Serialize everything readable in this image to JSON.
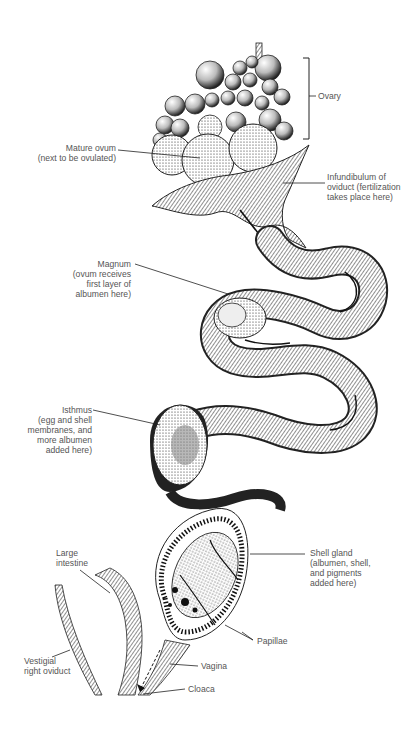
{
  "figure": {
    "labels": {
      "ovary": "Ovary",
      "mature_ovum": "Mature ovum\n(next to be ovulated)",
      "infundibulum": "Infundibulum of\noviduct (fertilization\ntakes place here)",
      "magnum": "Magnum\n(ovum receives\nfirst layer of\nalbumen here)",
      "isthmus": "Isthmus\n(egg and shell\nmembranes, and\nmore albumen\nadded here)",
      "shell_gland": "Shell gland\n(albumen, shell,\nand pigments\nadded here)",
      "large_intestine": "Large\nintestine",
      "papillae": "Papillae",
      "vestigial_right_oviduct": "Vestigial\nright oviduct",
      "vagina": "Vagina",
      "cloaca": "Cloaca"
    },
    "colors": {
      "ink": "#1a1a1a",
      "label_text": "#555555",
      "leader_line": "#222222",
      "background": "#ffffff"
    }
  }
}
